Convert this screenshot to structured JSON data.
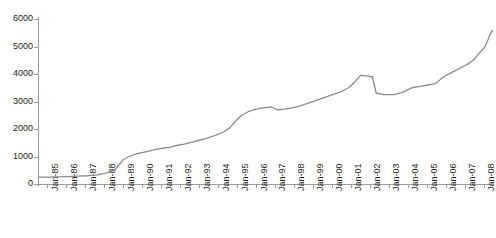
{
  "chart_data": {
    "type": "line",
    "title": "",
    "xlabel": "",
    "ylabel": "",
    "ylim": [
      0,
      6000
    ],
    "y_ticks": [
      0,
      1000,
      2000,
      3000,
      4000,
      5000,
      6000
    ],
    "grid": false,
    "legend": "none",
    "line_color": "#8c8c8c",
    "axis_color": "#9a9a9a",
    "text_color": "#231f20",
    "x_tick_labels": [
      "Jan-85",
      "Jan-86",
      "Jan-87",
      "Jan-88",
      "Jan-89",
      "Jan-90",
      "Jan-91",
      "Jan-92",
      "Jan-93",
      "Jan-94",
      "Jan-95",
      "Jan-96",
      "Jan-97",
      "Jan-98",
      "Jan-99",
      "Jan-00",
      "Jan-01",
      "Jan-02",
      "Jan-03",
      "Jan-04",
      "Jan-05",
      "Jan-06",
      "Jan-07",
      "Jan-08"
    ],
    "x": [
      1985.0,
      1985.5,
      1986.0,
      1986.5,
      1987.0,
      1987.5,
      1988.0,
      1988.3,
      1988.6,
      1988.9,
      1989.1,
      1989.3,
      1989.6,
      1989.9,
      1990.2,
      1990.5,
      1990.9,
      1991.3,
      1991.7,
      1992.0,
      1992.4,
      1992.8,
      1993.2,
      1993.6,
      1994.0,
      1994.4,
      1994.7,
      1995.0,
      1995.3,
      1995.6,
      1995.9,
      1996.2,
      1996.5,
      1996.8,
      1997.1,
      1997.5,
      1997.9,
      1998.3,
      1998.7,
      1999.1,
      1999.5,
      1999.9,
      2000.3,
      2000.7,
      2001.0,
      2001.3,
      2001.6,
      2001.9,
      2002.1,
      2002.5,
      2003.0,
      2003.5,
      2003.9,
      2004.3,
      2004.7,
      2005.1,
      2005.5,
      2005.9,
      2006.3,
      2006.7,
      2007.0,
      2007.3,
      2007.6,
      2007.9,
      2008.0
    ],
    "y": [
      250,
      250,
      260,
      270,
      285,
      300,
      330,
      380,
      430,
      520,
      700,
      880,
      1000,
      1080,
      1130,
      1180,
      1250,
      1300,
      1340,
      1400,
      1450,
      1520,
      1600,
      1680,
      1780,
      1900,
      2050,
      2300,
      2500,
      2620,
      2700,
      2750,
      2780,
      2800,
      2700,
      2720,
      2780,
      2850,
      2950,
      3050,
      3150,
      3250,
      3350,
      3500,
      3700,
      3950,
      3930,
      3900,
      3300,
      3250,
      3250,
      3350,
      3500,
      3550,
      3600,
      3650,
      3900,
      4050,
      4200,
      4350,
      4500,
      4750,
      5000,
      5500,
      5600
    ],
    "series_name": "value"
  }
}
